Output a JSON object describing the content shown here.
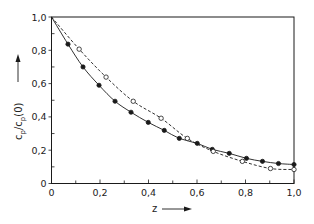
{
  "chart_data": {
    "type": "line",
    "title": "",
    "xlabel": "z",
    "ylabel": "c_p/c_p(0)",
    "xlim": [
      0,
      1.0
    ],
    "ylim": [
      0,
      1.0
    ],
    "x_ticks": [
      "0",
      "0,2",
      "0,4",
      "0,6",
      "0,8",
      "1,0"
    ],
    "y_ticks": [
      "0",
      "0,2",
      "0,4",
      "0,6",
      "0,8",
      "1,0"
    ],
    "x_tick_values": [
      0,
      0.2,
      0.4,
      0.6,
      0.8,
      1.0
    ],
    "y_tick_values": [
      0,
      0.2,
      0.4,
      0.6,
      0.8,
      1.0
    ],
    "minor_tick_step": 0.1,
    "grid": false,
    "legend": null,
    "series": [
      {
        "name": "filled markers (solid line)",
        "marker": "filled-circle",
        "line_style": "solid",
        "x": [
          0,
          0.068,
          0.13,
          0.196,
          0.262,
          0.328,
          0.399,
          0.465,
          0.527,
          0.601,
          0.663,
          0.733,
          0.804,
          0.87,
          0.936,
          1.0
        ],
        "y": [
          1.0,
          0.837,
          0.7,
          0.59,
          0.494,
          0.428,
          0.367,
          0.319,
          0.271,
          0.241,
          0.205,
          0.181,
          0.151,
          0.133,
          0.12,
          0.114
        ]
      },
      {
        "name": "open markers (dashed line)",
        "marker": "open-circle",
        "line_style": "dashed",
        "x": [
          0,
          0.114,
          0.225,
          0.337,
          0.452,
          0.56,
          0.667,
          0.787,
          0.903,
          1.0
        ],
        "y": [
          1.0,
          0.807,
          0.639,
          0.494,
          0.392,
          0.271,
          0.193,
          0.133,
          0.09,
          0.084
        ]
      }
    ]
  },
  "labels": {
    "y_main": "c",
    "y_sub1": "p",
    "y_slash": "/c",
    "y_sub2": "p",
    "y_tail": "(0)",
    "x_main": "z"
  },
  "colors": {
    "ink": "#1a1a1a",
    "background": "#ffffff"
  }
}
